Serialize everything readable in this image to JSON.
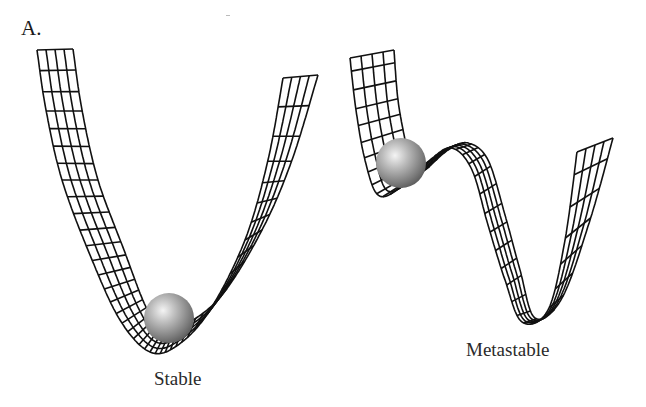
{
  "figure": {
    "panel_label": "A.",
    "diagrams": [
      {
        "id": "stable",
        "caption": "Stable",
        "surface": "single-well wireframe potential",
        "ball_position": "bottom of well"
      },
      {
        "id": "metastable",
        "caption": "Metastable",
        "surface": "double-well wireframe potential",
        "ball_position": "shallow local minimum (left well)"
      }
    ],
    "colors": {
      "mesh_stroke": "#111111",
      "ball_highlight": "#f2f2f2",
      "ball_shadow": "#555555",
      "background": "#ffffff"
    }
  }
}
